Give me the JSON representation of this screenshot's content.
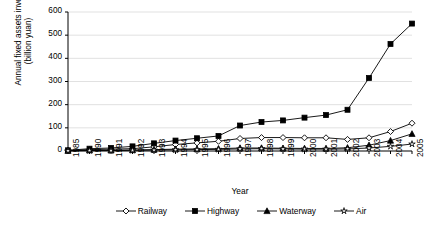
{
  "chart_data": {
    "type": "line",
    "title": "",
    "xlabel": "Year",
    "ylabel": "Annual fixed assets investment (billion yuan)",
    "ylabel_line1": "Annual fixed assets investment",
    "ylabel_line2": "(billion yuan)",
    "categories": [
      "1985",
      "1990",
      "1991",
      "1992",
      "1993",
      "1994",
      "1995",
      "1996",
      "1997",
      "1998",
      "1999",
      "2000",
      "2001",
      "2002",
      "2003",
      "2004",
      "2005"
    ],
    "ylim": [
      0,
      600
    ],
    "yticks": [
      0,
      100,
      200,
      300,
      400,
      500,
      600
    ],
    "ytick_labels": [
      "0",
      "100",
      "200",
      "300",
      "400",
      "500",
      "600"
    ],
    "grid": true,
    "legend_position": "bottom",
    "series": [
      {
        "name": "Railway",
        "marker": "diamond-open",
        "values": [
          2,
          6,
          8,
          10,
          18,
          28,
          35,
          42,
          54,
          58,
          58,
          57,
          57,
          50,
          57,
          84,
          120
        ]
      },
      {
        "name": "Highway",
        "marker": "square-filled",
        "values": [
          3,
          10,
          13,
          20,
          33,
          45,
          55,
          65,
          110,
          125,
          132,
          144,
          155,
          178,
          315,
          462,
          550
        ]
      },
      {
        "name": "Waterway",
        "marker": "triangle-filled",
        "values": [
          1,
          3,
          3,
          4,
          6,
          8,
          9,
          10,
          13,
          13,
          12,
          11,
          11,
          14,
          25,
          45,
          74
        ]
      },
      {
        "name": "Air",
        "marker": "star-open",
        "values": [
          1,
          2,
          2,
          3,
          4,
          5,
          6,
          7,
          9,
          10,
          9,
          8,
          8,
          9,
          13,
          20,
          30
        ]
      }
    ]
  },
  "axis_colors": {
    "axis": "#000000",
    "grid": "#d9d9d9",
    "series": "#000000"
  }
}
